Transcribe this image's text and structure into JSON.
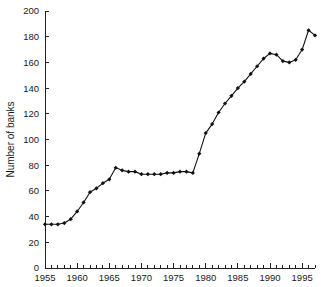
{
  "chart_data": {
    "type": "line",
    "title": "",
    "xlabel": "",
    "ylabel": "Number of banks",
    "xlim": [
      1955,
      1997
    ],
    "ylim": [
      0,
      200
    ],
    "grid": false,
    "legend": null,
    "marker": "filled-diamond",
    "x_ticks": [
      1955,
      1960,
      1965,
      1970,
      1975,
      1980,
      1985,
      1990,
      1995
    ],
    "x_tick_labels": [
      "1955",
      "1960",
      "1965",
      "1970",
      "1975",
      "1980",
      "1985",
      "1990",
      "1995"
    ],
    "x_minor_tick_step": 1,
    "y_ticks": [
      0,
      20,
      40,
      60,
      80,
      100,
      120,
      140,
      160,
      180,
      200
    ],
    "y_tick_labels": [
      "0",
      "20",
      "40",
      "60",
      "80",
      "100",
      "120",
      "140",
      "160",
      "180",
      "200"
    ],
    "x": [
      1955,
      1956,
      1957,
      1958,
      1959,
      1960,
      1961,
      1962,
      1963,
      1964,
      1965,
      1966,
      1967,
      1968,
      1969,
      1970,
      1971,
      1972,
      1973,
      1974,
      1975,
      1976,
      1977,
      1978,
      1979,
      1980,
      1981,
      1982,
      1983,
      1984,
      1985,
      1986,
      1987,
      1988,
      1989,
      1990,
      1991,
      1992,
      1993,
      1994,
      1995,
      1996,
      1997
    ],
    "values": [
      34,
      34,
      34,
      35,
      38,
      44,
      51,
      59,
      62,
      66,
      69,
      78,
      76,
      75,
      75,
      73,
      73,
      73,
      73,
      74,
      74,
      75,
      75,
      74,
      89,
      105,
      112,
      121,
      128,
      134,
      140,
      145,
      151,
      157,
      163,
      167,
      166,
      161,
      160,
      162,
      170,
      185,
      181
    ],
    "series": [
      {
        "name": "Number of banks",
        "values": [
          34,
          34,
          34,
          35,
          38,
          44,
          51,
          59,
          62,
          66,
          69,
          78,
          76,
          75,
          75,
          73,
          73,
          73,
          73,
          74,
          74,
          75,
          75,
          74,
          89,
          105,
          112,
          121,
          128,
          134,
          140,
          145,
          151,
          157,
          163,
          167,
          166,
          161,
          160,
          162,
          170,
          185,
          181
        ]
      }
    ],
    "color": "#111111"
  }
}
